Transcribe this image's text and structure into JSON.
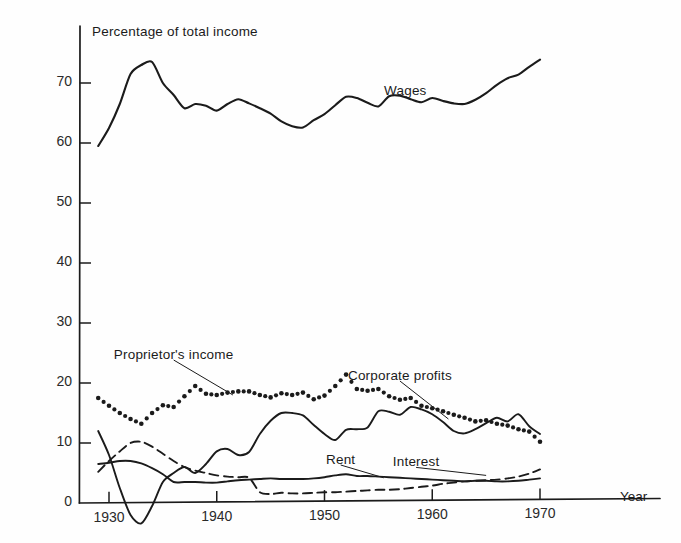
{
  "figure": {
    "background": "#fefefe",
    "ink": "#1b1b1b",
    "axis_title": "Percentage of total income",
    "x_axis_label": "Year"
  },
  "chart_data": {
    "type": "line",
    "title": "Percentage of total income",
    "xlabel": "Year",
    "ylabel": "Percentage of total income",
    "xlim": [
      1928.0,
      1972.0
    ],
    "ylim": [
      -5,
      77
    ],
    "grid": false,
    "legend": "inline-annotations",
    "x_ticks": [
      1930,
      1940,
      1950,
      1960,
      1970
    ],
    "x_tick_labels": [
      "1930",
      "1940",
      "1950",
      "1960",
      "1970"
    ],
    "y_ticks": [
      0,
      10,
      20,
      30,
      40,
      50,
      60,
      70
    ],
    "y_tick_labels": [
      "0",
      "10",
      "20",
      "30",
      "40",
      "50",
      "60",
      "70"
    ],
    "x": [
      1929,
      1930,
      1931,
      1932,
      1933,
      1934,
      1935,
      1936,
      1937,
      1938,
      1939,
      1940,
      1941,
      1942,
      1943,
      1944,
      1945,
      1946,
      1947,
      1948,
      1949,
      1950,
      1951,
      1952,
      1953,
      1954,
      1955,
      1956,
      1957,
      1958,
      1959,
      1960,
      1961,
      1962,
      1963,
      1964,
      1965,
      1966,
      1967,
      1968,
      1969,
      1970
    ],
    "series": [
      {
        "name": "Wages",
        "style": "solid",
        "label_x": 1957.5,
        "label_y": 68.5,
        "values": [
          59.5,
          62.5,
          66.5,
          71.5,
          73.0,
          73.5,
          70.0,
          68.0,
          65.8,
          66.5,
          66.2,
          65.4,
          66.5,
          67.3,
          66.6,
          65.8,
          64.9,
          63.6,
          62.8,
          62.6,
          63.8,
          64.8,
          66.3,
          67.7,
          67.5,
          66.7,
          66.1,
          67.8,
          67.9,
          67.3,
          66.8,
          67.5,
          67.0,
          66.6,
          66.5,
          67.2,
          68.3,
          69.7,
          70.8,
          71.4,
          72.7,
          73.9
        ]
      },
      {
        "name": "Proprietor's income",
        "style": "dotted",
        "label_x": 1936.0,
        "label_y": 24.5,
        "leader_to_x": 1941.5,
        "leader_to_y": 18.0,
        "values": [
          17.5,
          16.2,
          15.0,
          14.0,
          13.2,
          15.0,
          16.3,
          16.0,
          17.8,
          19.5,
          18.2,
          18.0,
          18.4,
          18.6,
          18.6,
          18.0,
          17.6,
          18.3,
          18.0,
          18.4,
          17.3,
          17.9,
          19.5,
          21.4,
          19.0,
          18.7,
          19.0,
          17.8,
          17.2,
          17.5,
          16.2,
          15.8,
          15.3,
          14.7,
          14.2,
          13.6,
          13.8,
          13.2,
          12.9,
          12.3,
          11.9,
          10.2
        ]
      },
      {
        "name": "Corporate profits",
        "style": "solid",
        "label_x": 1957.0,
        "label_y": 21.0,
        "leader_to_x": 1961.5,
        "leader_to_y": 14.0,
        "values": [
          12.0,
          8.0,
          2.5,
          -2.0,
          -3.4,
          -0.5,
          3.5,
          5.0,
          6.0,
          5.0,
          6.5,
          8.6,
          9.0,
          8.0,
          8.5,
          11.5,
          13.7,
          15.0,
          15.0,
          14.6,
          13.0,
          11.5,
          10.5,
          12.2,
          12.3,
          12.6,
          15.3,
          15.2,
          14.7,
          16.0,
          15.6,
          14.8,
          13.5,
          12.0,
          11.6,
          12.3,
          13.3,
          14.2,
          13.6,
          14.8,
          12.8,
          11.5
        ]
      },
      {
        "name": "Rent",
        "style": "solid",
        "label_x": 1951.5,
        "label_y": 7.0,
        "leader_to_x": 1955.5,
        "leader_to_y": 4.2,
        "values": [
          6.5,
          6.7,
          7.0,
          7.0,
          6.6,
          5.8,
          4.8,
          3.5,
          3.5,
          3.5,
          3.4,
          3.4,
          3.6,
          3.8,
          3.9,
          4.0,
          4.1,
          4.0,
          4.0,
          4.0,
          4.1,
          4.3,
          4.6,
          4.8,
          4.5,
          4.5,
          4.4,
          4.3,
          4.2,
          4.1,
          4.0,
          3.9,
          3.8,
          3.7,
          3.6,
          3.7,
          3.7,
          3.6,
          3.6,
          3.7,
          3.9,
          4.1
        ]
      },
      {
        "name": "Interest",
        "style": "dashed",
        "label_x": 1958.5,
        "label_y": 6.6,
        "leader_to_x": 1965.0,
        "leader_to_y": 4.6,
        "values": [
          5.2,
          7.0,
          8.6,
          10.0,
          10.2,
          9.4,
          8.2,
          7.0,
          6.0,
          5.4,
          5.0,
          4.6,
          4.4,
          4.3,
          4.2,
          1.8,
          1.5,
          1.7,
          1.6,
          1.6,
          1.7,
          1.8,
          1.8,
          1.9,
          2.0,
          2.1,
          2.2,
          2.2,
          2.3,
          2.5,
          2.7,
          2.9,
          3.2,
          3.4,
          3.6,
          3.7,
          3.8,
          3.9,
          4.1,
          4.4,
          4.9,
          5.6
        ]
      }
    ]
  }
}
